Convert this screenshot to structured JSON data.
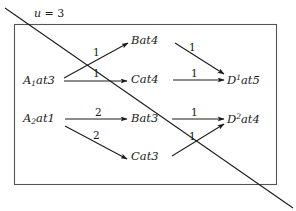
{
  "figure": {
    "type": "diagram",
    "stroke_color": "#1a1a1a",
    "background_color": "#ffffff",
    "box_color": "#555555"
  },
  "cut": {
    "label_var": "u",
    "label_eq": "=",
    "label_value": "3",
    "label_full": "u = 3"
  },
  "nodes": {
    "left": [
      {
        "id": "a1",
        "base": "A",
        "sub": "1",
        "tail": "at3",
        "text": "A1at3"
      },
      {
        "id": "a2",
        "base": "A",
        "sub": "2",
        "tail": "at1",
        "text": "A2at1"
      }
    ],
    "middle": [
      {
        "id": "b4",
        "text": "Bat4"
      },
      {
        "id": "c4",
        "text": "Cat4"
      },
      {
        "id": "b3",
        "text": "Bat3"
      },
      {
        "id": "c3",
        "text": "Cat3"
      }
    ],
    "right": [
      {
        "id": "d1",
        "base": "D",
        "sup": "1",
        "tail": "at5",
        "text": "D1at5"
      },
      {
        "id": "d2",
        "base": "D",
        "sup": "2",
        "tail": "at4",
        "text": "D2at4"
      }
    ]
  },
  "edges": [
    {
      "id": "e1",
      "from": "a1",
      "to": "b4",
      "weight": "1"
    },
    {
      "id": "e2",
      "from": "a1",
      "to": "c4",
      "weight": "1"
    },
    {
      "id": "e3",
      "from": "a2",
      "to": "b3",
      "weight": "2"
    },
    {
      "id": "e4",
      "from": "a2",
      "to": "c3",
      "weight": "2"
    },
    {
      "id": "e5",
      "from": "b4",
      "to": "d1",
      "weight": "1"
    },
    {
      "id": "e6",
      "from": "c4",
      "to": "d1",
      "weight": "1"
    },
    {
      "id": "e7",
      "from": "b3",
      "to": "d2",
      "weight": "1"
    },
    {
      "id": "e8",
      "from": "c3",
      "to": "d2",
      "weight": "1"
    }
  ]
}
